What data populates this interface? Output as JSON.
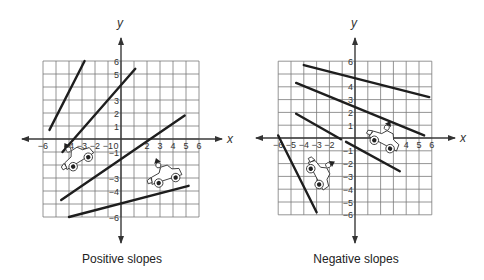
{
  "figures": [
    {
      "id": "positive",
      "caption": "Positive slopes",
      "x_label": "x",
      "y_label": "y",
      "x_ticks": [
        "-6",
        "-4",
        "-3",
        "-2",
        "-1",
        "0",
        "2",
        "3",
        "4",
        "5",
        "6"
      ],
      "y_ticks": [
        "6",
        "5",
        "3",
        "2",
        "1",
        "-1",
        "-3",
        "-4",
        "-6"
      ]
    },
    {
      "id": "negative",
      "caption": "Negative slopes",
      "x_label": "x",
      "y_label": "y",
      "x_ticks": [
        "-6",
        "-5",
        "-4",
        "-3",
        "-2",
        "4",
        "5",
        "6"
      ],
      "y_ticks": [
        "6",
        "4",
        "3",
        "2",
        "1",
        "-1",
        "-2",
        "-3",
        "-4",
        "-5",
        "-6"
      ]
    }
  ],
  "chart_data": [
    {
      "type": "line",
      "title": "Positive slopes",
      "xlabel": "x",
      "ylabel": "y",
      "xlim": [
        -6,
        6
      ],
      "ylim": [
        -6,
        6
      ],
      "grid": true,
      "series": [
        {
          "name": "line 1",
          "points": [
            [
              -5.5,
              0.7
            ],
            [
              -2.8,
              6
            ]
          ]
        },
        {
          "name": "line 2",
          "points": [
            [
              -4.5,
              -1
            ],
            [
              1.1,
              5.4
            ]
          ]
        },
        {
          "name": "line 3",
          "points": [
            [
              -4.6,
              -4.7
            ],
            [
              4.9,
              1.8
            ]
          ]
        },
        {
          "name": "line 4",
          "points": [
            [
              -4,
              -6
            ],
            [
              5.2,
              -3.6
            ]
          ]
        }
      ],
      "annotations": [
        "car driving uphill on line 3",
        "car driving uphill on line 4"
      ]
    },
    {
      "type": "line",
      "title": "Negative slopes",
      "xlabel": "x",
      "ylabel": "y",
      "xlim": [
        -6,
        6
      ],
      "ylim": [
        -6,
        6
      ],
      "grid": true,
      "series": [
        {
          "name": "line 1",
          "points": [
            [
              -4,
              5.7
            ],
            [
              5.8,
              3.2
            ]
          ]
        },
        {
          "name": "line 2",
          "points": [
            [
              -4.6,
              4.3
            ],
            [
              5.4,
              0.2
            ]
          ]
        },
        {
          "name": "line 3",
          "points": [
            [
              -4.6,
              1.9
            ],
            [
              -1.1,
              -0.1
            ]
          ]
        },
        {
          "name": "line 4",
          "points": [
            [
              -0.7,
              -0.3
            ],
            [
              3.5,
              -2.6
            ]
          ]
        },
        {
          "name": "line 5",
          "points": [
            [
              -6,
              0.2
            ],
            [
              -3,
              -5.8
            ]
          ]
        }
      ],
      "annotations": [
        "car driving downhill on line 4",
        "car driving downhill on line 5"
      ]
    }
  ]
}
